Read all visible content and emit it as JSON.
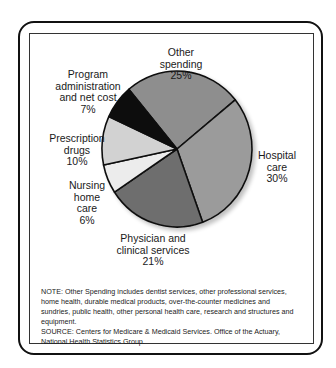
{
  "chart_data": {
    "type": "pie",
    "title": "",
    "start_angle_deg": -40,
    "slices": [
      {
        "label": "Other spending",
        "value": 25,
        "color": "#8e8e8e"
      },
      {
        "label": "Hospital care",
        "value": 30,
        "color": "#9b9b9b"
      },
      {
        "label": "Physician and clinical services",
        "value": 21,
        "color": "#6e6e6e"
      },
      {
        "label": "Nursing home care",
        "value": 6,
        "color": "#ececec"
      },
      {
        "label": "Prescription drugs",
        "value": 10,
        "color": "#d2d2d2"
      },
      {
        "label": "Program administration and net cost",
        "value": 7,
        "color": "#0d0d0d"
      }
    ],
    "unit": "%"
  },
  "labels": {
    "other": {
      "line1": "Other spending",
      "pct": "25%"
    },
    "hospital": {
      "line1": "Hospital",
      "line2": "care",
      "pct": "30%"
    },
    "physician": {
      "line1": "Physician and",
      "line2": "clinical services",
      "pct": "21%"
    },
    "nursing": {
      "line1": "Nursing",
      "line2": "home",
      "line3": "care",
      "pct": "6%"
    },
    "prescription": {
      "line1": "Prescription",
      "line2": "drugs",
      "pct": "10%"
    },
    "program": {
      "line1": "Program",
      "line2": "administration",
      "line3": "and net cost",
      "pct": "7%"
    }
  },
  "footnote": {
    "note": "NOTE: Other Spending includes dentist services, other professional services, home health, durable medical products, over-the-counter medicines and sundries, public health, other personal health care, research and structures and equipment.",
    "source": "SOURCE: Centers for Medicare & Medicaid Services. Office of the Actuary, National Health Statistics Group."
  }
}
